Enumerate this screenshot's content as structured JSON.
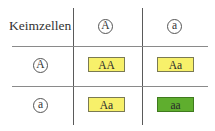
{
  "header": {
    "corner_label": "Keimzellen",
    "columns": [
      "A",
      "a"
    ]
  },
  "rows": [
    {
      "gamete": "A",
      "cells": [
        {
          "genotype": "AA",
          "color": "#f7f06a"
        },
        {
          "genotype": "Aa",
          "color": "#f7f06a"
        }
      ]
    },
    {
      "gamete": "a",
      "cells": [
        {
          "genotype": "Aa",
          "color": "#f7f06a"
        },
        {
          "genotype": "aa",
          "color": "#5fae2e"
        }
      ]
    }
  ],
  "colors": {
    "dominant_phenotype": "#f7f06a",
    "recessive_phenotype": "#5fae2e",
    "grid_line": "#5a5a5a"
  }
}
